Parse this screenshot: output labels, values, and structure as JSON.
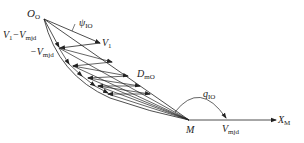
{
  "diagram": {
    "type": "vector-diagram",
    "labels": {
      "origin": {
        "main": "O",
        "sub": "O"
      },
      "angle_psi": {
        "main": "ψ",
        "sub": "IO"
      },
      "v1": {
        "main": "V",
        "sub": "1"
      },
      "v1_minus_vmjd": {
        "main": "V",
        "sub1": "1",
        "mid": "−V",
        "sub2": "mjd"
      },
      "neg_vmjd": {
        "main": "−V",
        "sub": "mjd"
      },
      "d_mo": {
        "main": "D",
        "sub": "mO"
      },
      "angle_q": {
        "main": "q",
        "sub": "IO"
      },
      "m_point": {
        "main": "M"
      },
      "vmjd": {
        "main": "V",
        "sub": "mjd"
      },
      "x_axis": {
        "main": "X",
        "sub": "M"
      }
    },
    "colors": {
      "line": "#222222",
      "background": "#ffffff"
    }
  }
}
